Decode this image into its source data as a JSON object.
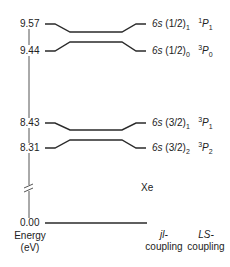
{
  "diagram": {
    "element": "Xe",
    "axis": {
      "title_line1": "Energy",
      "title_line2": "(eV)",
      "ticks": [
        "9.57",
        "9.44",
        "8.43",
        "8.31",
        "0.00"
      ],
      "has_break": true
    },
    "levels": [
      {
        "energy": "9.57",
        "jl_config": "6s",
        "jl_core": "(1/2)",
        "jl_sub": "1",
        "ls_sup": "1",
        "ls_term": "P",
        "ls_sub": "1"
      },
      {
        "energy": "9.44",
        "jl_config": "6s",
        "jl_core": "(1/2)",
        "jl_sub": "0",
        "ls_sup": "3",
        "ls_term": "P",
        "ls_sub": "0"
      },
      {
        "energy": "8.43",
        "jl_config": "6s",
        "jl_core": "(3/2)",
        "jl_sub": "1",
        "ls_sup": "3",
        "ls_term": "P",
        "ls_sub": "1"
      },
      {
        "energy": "8.31",
        "jl_config": "6s",
        "jl_core": "(3/2)",
        "jl_sub": "2",
        "ls_sup": "3",
        "ls_term": "P",
        "ls_sub": "2"
      },
      {
        "energy": "0.00",
        "ground": true
      }
    ],
    "columns": {
      "jl": {
        "line1": "jl-",
        "line2": "coupling"
      },
      "ls": {
        "line1": "LS-",
        "line2": "coupling"
      }
    },
    "colors": {
      "line": "#2a2a2a",
      "text": "#222222",
      "background": "#ffffff"
    }
  }
}
